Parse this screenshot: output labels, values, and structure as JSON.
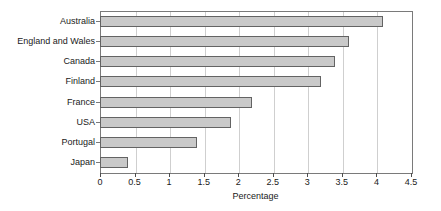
{
  "chart_data": {
    "type": "bar",
    "orientation": "horizontal",
    "title": "",
    "xlabel": "Percentage",
    "ylabel": "",
    "categories": [
      "Australia",
      "England and Wales",
      "Canada",
      "Finland",
      "France",
      "USA",
      "Portugal",
      "Japan"
    ],
    "values": [
      4.1,
      3.6,
      3.4,
      3.2,
      2.2,
      1.9,
      1.4,
      0.4
    ],
    "xlim": [
      0,
      4.5
    ],
    "xticks": [
      0,
      0.5,
      1,
      1.5,
      2,
      2.5,
      3,
      3.5,
      4,
      4.5
    ],
    "xticklabels": [
      "0",
      "0.5",
      "1",
      "1.5",
      "2",
      "2.5",
      "3",
      "3.5",
      "4",
      "4.5"
    ],
    "grid": "vertical",
    "legend": "none",
    "bar_fill_color": "#c9c9c9",
    "bar_border_color": "#636363",
    "gridline_color": "#cfcfcf",
    "axis_color": "#7a7a7a",
    "background_color": "#ffffff"
  }
}
